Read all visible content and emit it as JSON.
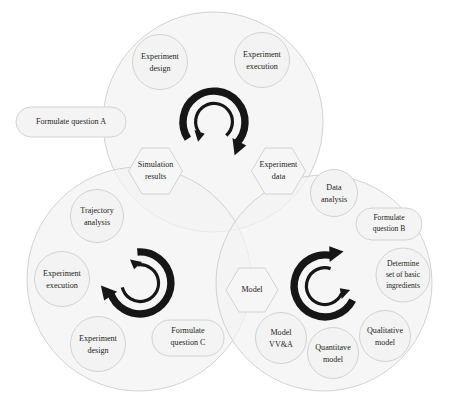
{
  "diagram": {
    "colors": {
      "circle_fill": "#f2f2f2",
      "circle_stroke": "#c8c8c8",
      "node_fill": "#f3f3f3",
      "node_stroke": "#c9c9c9",
      "arrow": "#161616",
      "text": "#231f20",
      "background": "#ffffff"
    },
    "cycles": [
      {
        "id": "top",
        "name": "experiment-simulation-cycle",
        "arrow_icon": "double-circular-arrow-icon"
      },
      {
        "id": "bottom-left",
        "name": "experiment-cycle",
        "arrow_icon": "double-circular-arrow-icon"
      },
      {
        "id": "bottom-right",
        "name": "modelling-cycle",
        "arrow_icon": "double-circular-arrow-icon"
      }
    ]
  },
  "labels": {
    "formulate_question_a": {
      "line1": "Formulate question A"
    },
    "experiment_design_top": {
      "line1": "Experiment",
      "line2": "design"
    },
    "experiment_execution_top": {
      "line1": "Experiment",
      "line2": "execution"
    },
    "simulation_results": {
      "line1": "Simulation",
      "line2": "results"
    },
    "experiment_data": {
      "line1": "Experiment",
      "line2": "data"
    },
    "trajectory_analysis": {
      "line1": "Trajectory",
      "line2": "analysis"
    },
    "experiment_execution_left": {
      "line1": "Experiment",
      "line2": "execution"
    },
    "experiment_design_left": {
      "line1": "Experiment",
      "line2": "design"
    },
    "formulate_question_c": {
      "line1": "Formulate",
      "line2": "question C"
    },
    "data_analysis": {
      "line1": "Data",
      "line2": "analysis"
    },
    "formulate_question_b": {
      "line1": "Formulate",
      "line2": "question B"
    },
    "determine_ingredients": {
      "line1": "Determine",
      "line2": "set of basic",
      "line3": "ingredients"
    },
    "qualitative_model": {
      "line1": "Qualitative",
      "line2": "model"
    },
    "quantitave_model": {
      "line1": "Quantitave",
      "line2": "model"
    },
    "model_vva": {
      "line1": "Model",
      "line2": "VV&A"
    },
    "model_hex": {
      "line1": "Model"
    }
  }
}
